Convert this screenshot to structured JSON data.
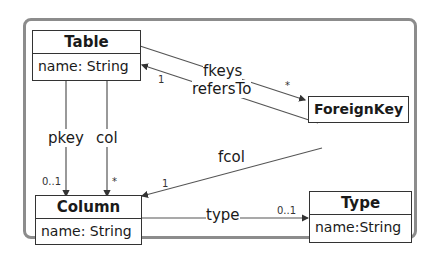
{
  "diagram": {
    "type": "UML class diagram",
    "classes": {
      "table": {
        "name": "Table",
        "attribute": "name: String"
      },
      "foreign_key": {
        "name": "ForeignKey"
      },
      "column": {
        "name": "Column",
        "attribute": "name: String"
      },
      "type": {
        "name": "Type",
        "attribute": "name:String"
      }
    },
    "associations": {
      "fkeys": {
        "label": "fkeys",
        "multiplicity": "*"
      },
      "refers_to": {
        "label": "refersTo",
        "multiplicity": "1"
      },
      "pkey": {
        "label": "pkey",
        "multiplicity": "0..1"
      },
      "col": {
        "label": "col",
        "multiplicity": "*"
      },
      "fcol": {
        "label": "fcol",
        "multiplicity": "1"
      },
      "type": {
        "label": "type",
        "multiplicity": "0..1"
      }
    },
    "colors": {
      "frame": "#8c8c8c",
      "line": "#333333",
      "text": "#1a1a1a"
    }
  }
}
